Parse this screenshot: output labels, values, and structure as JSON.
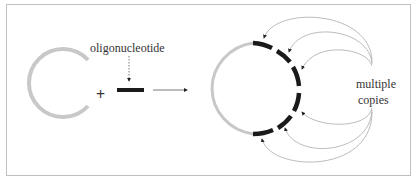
{
  "diagram": {
    "labels": {
      "oligonucleotide": "oligonucleotide",
      "plus": "+",
      "multiple_line1": "multiple",
      "multiple_line2": "copies"
    },
    "colors": {
      "plasmid": "#c8c8c8",
      "oligo": "#1a1a1a",
      "arrow": "#555555",
      "curve": "#aaaaaa",
      "border": "#c0c0c0"
    }
  }
}
